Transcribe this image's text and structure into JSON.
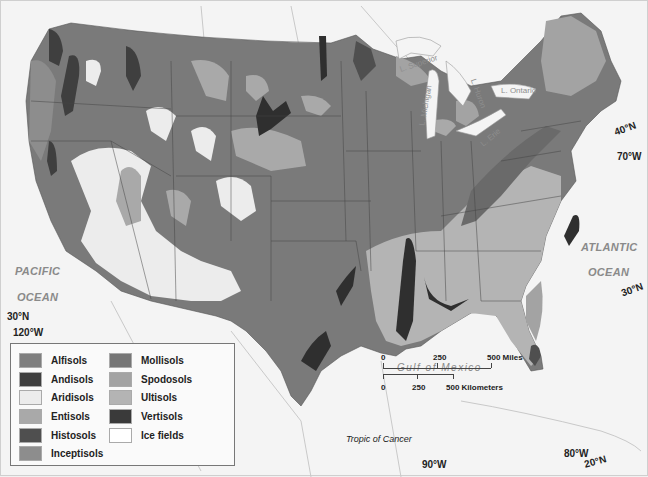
{
  "map": {
    "title": "Soil orders of the contiguous United States",
    "water_labels": {
      "pacific_1": "PACIFIC",
      "pacific_2": "OCEAN",
      "atlantic_1": "ATLANTIC",
      "atlantic_2": "OCEAN",
      "gulf": "Gulf of Mexico",
      "lake_superior": "L. Superior",
      "lake_michigan": "L. Michigan",
      "lake_huron": "L. Huron",
      "lake_erie": "L. Erie",
      "lake_ontario": "L. Ontario"
    },
    "graticule_labels": {
      "lat_40n": "40°N",
      "lon_70w": "70°W",
      "lat_30n_east": "30°N",
      "lat_30n_west": "30°N",
      "lon_120w": "120°W",
      "lon_90w": "90°W",
      "lon_80w": "80°W",
      "lat_20n": "20°N",
      "tropic": "Tropic of Cancer"
    }
  },
  "legend": {
    "items": [
      {
        "label": "Alfisols",
        "color": "#7f7f7f"
      },
      {
        "label": "Andisols",
        "color": "#3f3f3f"
      },
      {
        "label": "Aridisols",
        "color": "#ececec"
      },
      {
        "label": "Entisols",
        "color": "#a9a9a9"
      },
      {
        "label": "Histosols",
        "color": "#4f4f4f"
      },
      {
        "label": "Inceptisols",
        "color": "#8d8d8d"
      },
      {
        "label": "Mollisols",
        "color": "#767676"
      },
      {
        "label": "Spodosols",
        "color": "#a3a3a3"
      },
      {
        "label": "Ultisols",
        "color": "#b4b4b4"
      },
      {
        "label": "Vertisols",
        "color": "#3a3a3a"
      },
      {
        "label": "Ice fields",
        "color": "#ffffff"
      }
    ]
  },
  "scale": {
    "miles": {
      "t0": "0",
      "t1": "250",
      "t2": "500 Miles"
    },
    "km": {
      "t0": "0",
      "t1": "250",
      "t2": "500 Kilometers"
    }
  }
}
